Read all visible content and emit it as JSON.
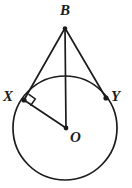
{
  "figure": {
    "type": "geometry-diagram",
    "background_color": "#ffffff",
    "stroke_color": "#1b1b1b",
    "labels": {
      "apex": "B",
      "tangent_point_left": "X",
      "tangent_point_right": "Y",
      "center": "O"
    },
    "geometry": {
      "circle": {
        "cx": 65,
        "cy": 128,
        "r": 52
      },
      "points": {
        "B": {
          "x": 65,
          "y": 28
        },
        "X": {
          "x": 24,
          "y": 100
        },
        "Y": {
          "x": 106,
          "y": 98
        },
        "O": {
          "x": 66,
          "y": 128
        }
      },
      "segments": [
        {
          "name": "tangent-BX",
          "from": "B",
          "to": "X"
        },
        {
          "name": "tangent-BY",
          "from": "B",
          "to": "Y"
        },
        {
          "name": "line-BO",
          "from": "B",
          "to": "O"
        },
        {
          "name": "radius-OX",
          "from": "X",
          "to": "O"
        }
      ],
      "right_angle_at": "X"
    }
  }
}
